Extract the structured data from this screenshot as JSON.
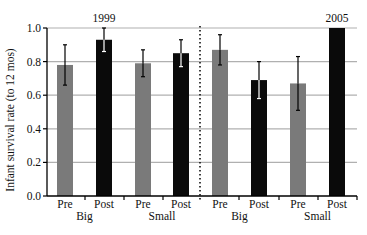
{
  "chart_data": {
    "type": "bar",
    "title": "",
    "xlabel": "",
    "ylabel": "Infant survival rate (to 12 mos)",
    "ylim": [
      0.0,
      1.0
    ],
    "yticks": [
      "0.0",
      "0.2",
      "0.4",
      "0.6",
      "0.8",
      "1.0"
    ],
    "grid": true,
    "legend": null,
    "groups": [
      {
        "year": "1999",
        "subgroups": [
          {
            "name": "Big",
            "bars": [
              {
                "label": "Pre",
                "value": 0.78,
                "err_low": 0.66,
                "err_high": 0.9,
                "color": "#7a7a7a"
              },
              {
                "label": "Post",
                "value": 0.93,
                "err_low": 0.86,
                "err_high": 1.0,
                "color": "#0a0a0a"
              }
            ]
          },
          {
            "name": "Small",
            "bars": [
              {
                "label": "Pre",
                "value": 0.79,
                "err_low": 0.71,
                "err_high": 0.87,
                "color": "#7a7a7a"
              },
              {
                "label": "Post",
                "value": 0.85,
                "err_low": 0.77,
                "err_high": 0.93,
                "color": "#0a0a0a"
              }
            ]
          }
        ]
      },
      {
        "year": "2005",
        "subgroups": [
          {
            "name": "Big",
            "bars": [
              {
                "label": "Pre",
                "value": 0.87,
                "err_low": 0.78,
                "err_high": 0.96,
                "color": "#7a7a7a"
              },
              {
                "label": "Post",
                "value": 0.69,
                "err_low": 0.58,
                "err_high": 0.8,
                "color": "#0a0a0a"
              }
            ]
          },
          {
            "name": "Small",
            "bars": [
              {
                "label": "Pre",
                "value": 0.67,
                "err_low": 0.51,
                "err_high": 0.83,
                "color": "#7a7a7a"
              },
              {
                "label": "Post",
                "value": 1.0,
                "err_low": null,
                "err_high": null,
                "color": "#0a0a0a"
              }
            ]
          }
        ]
      }
    ],
    "annotations": [
      "1999",
      "2005"
    ]
  },
  "colors": {
    "pre": "#7a7a7a",
    "post": "#0a0a0a",
    "grid": "#b0b0b0",
    "axis": "#000000"
  }
}
